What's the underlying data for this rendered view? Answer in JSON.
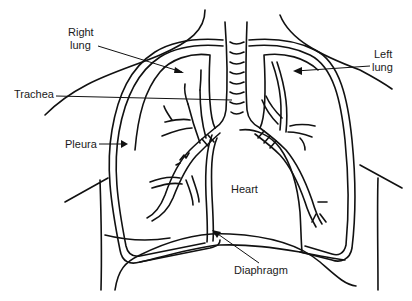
{
  "diagram": {
    "labels": {
      "right_lung_line1": "Right",
      "right_lung_line2": "lung",
      "left_lung_line1": "Left",
      "left_lung_line2": "lung",
      "trachea": "Trachea",
      "pleura": "Pleura",
      "heart": "Heart",
      "diaphragm": "Diaphragm"
    },
    "colors": {
      "ink": "#111111",
      "background": "#ffffff"
    }
  }
}
